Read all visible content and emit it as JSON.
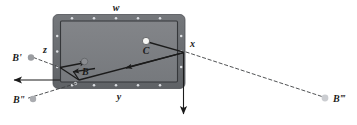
{
  "figure": {
    "type": "billiards-bank-shot-diagram",
    "background_color": "#ffffff",
    "table": {
      "rail_color": "#6d7074",
      "rail_edge_color": "#5b5e62",
      "cloth_color": "#7d8084",
      "cloth_border_color": "#3a3c3f",
      "diamond_color": "#d8dade",
      "top_rail_diamond_count": 5,
      "bottom_rail_diamond_count": 5,
      "left_rail_diamond_count": 3,
      "right_rail_diamond_count": 3
    },
    "labels": {
      "w": "w",
      "x": "x",
      "y": "y",
      "z": "z",
      "ball_c": "C",
      "ball_b": "B",
      "ball_b_prime": "B'",
      "ball_b_double_prime": "B\"",
      "ball_b_triple_prime": "B‴"
    },
    "balls": {
      "cue_ball_c": {
        "label": "C",
        "color": "#f7f7f5",
        "stroke": "#4a4c4f"
      },
      "object_ball_b": {
        "label": "B",
        "color": "#8b8d91",
        "stroke": "#55585c"
      },
      "ghost_b_prime": {
        "label": "B'",
        "color": "#9a9ca0"
      },
      "ghost_b_double_prime": {
        "label": "B\"",
        "color": "#a8aaae"
      },
      "ghost_b_triple_prime": {
        "label": "B‴",
        "color": "#c9cbcf"
      }
    },
    "lines": {
      "solid_color": "#1b1b1b",
      "dashed_color": "#3d3f42",
      "solid_description": "aim and rebound path lines with arrowheads",
      "dashed_description": "construction lines to mirrored ghost ball positions"
    }
  }
}
